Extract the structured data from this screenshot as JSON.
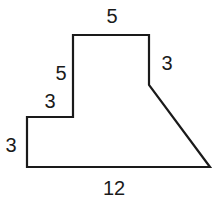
{
  "figure": {
    "type": "composite polygon",
    "stroke_color": "#1a1a1a",
    "fill_color": "#ffffff",
    "labels": {
      "top": "5",
      "right_upper": "3",
      "left_upper": "5",
      "step": "3",
      "left_lower": "3",
      "bottom": "12"
    }
  }
}
